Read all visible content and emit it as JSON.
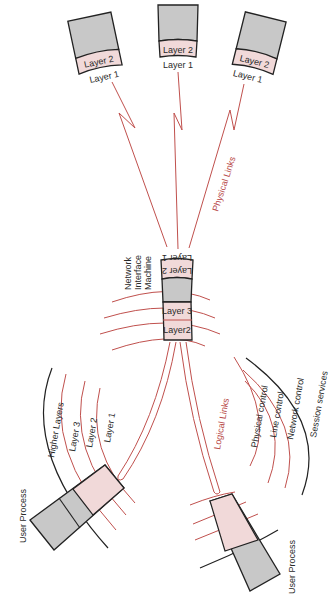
{
  "diagram": {
    "terminals": [
      {
        "layer2_label": "Layer 2",
        "layer1_label": "Layer 1"
      },
      {
        "layer2_label": "Layer 2",
        "layer1_label": "Layer 1"
      },
      {
        "layer2_label": "Layer 2",
        "layer1_label": "Layer 1"
      }
    ],
    "physical_links_label": "Physical Links",
    "network_interface_machine": {
      "label_line1": "Network",
      "label_line2": "Interface",
      "label_line3": "Machine",
      "upper_layer2_label": "Layer 2",
      "upper_layer1_label": "Layer 1",
      "layer3_label": "Layer 3",
      "layer2_label": "Layer2"
    },
    "logical_links_label": "Logical Links",
    "left_user_process": {
      "label": "User Process",
      "arcs": [
        "Higher Layers",
        "Layer 3",
        "Layer 2",
        "Layer 1"
      ]
    },
    "right_user_process": {
      "label": "User Process",
      "arcs": [
        "Session services",
        "Network control",
        "Line control",
        "Physical control"
      ]
    },
    "colors": {
      "red": "#c0504d",
      "pink": "#f1d9d9",
      "gray": "#c8c8c8",
      "black": "#222222"
    }
  }
}
